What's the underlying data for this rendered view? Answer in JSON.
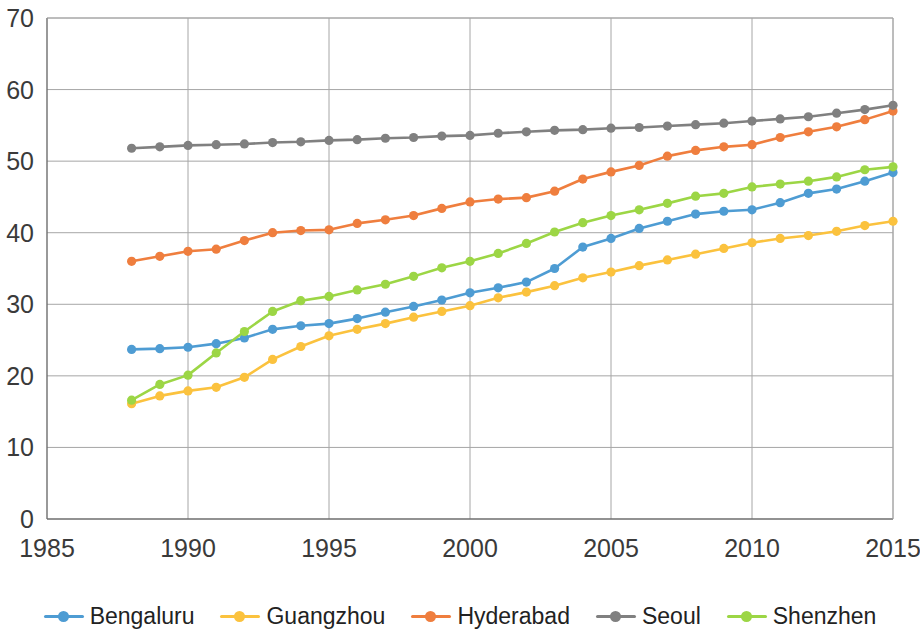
{
  "chart_data": {
    "type": "line",
    "title": "",
    "xlabel": "",
    "ylabel": "",
    "xlim": [
      1985,
      2015
    ],
    "ylim": [
      0,
      70
    ],
    "x_ticks": [
      1985,
      1990,
      1995,
      2000,
      2005,
      2010,
      2015
    ],
    "y_ticks": [
      0,
      10,
      20,
      30,
      40,
      50,
      60,
      70
    ],
    "grid": true,
    "legend_position": "bottom",
    "markers": "circle",
    "x": [
      1988,
      1989,
      1990,
      1991,
      1992,
      1993,
      1994,
      1995,
      1996,
      1997,
      1998,
      1999,
      2000,
      2001,
      2002,
      2003,
      2004,
      2005,
      2006,
      2007,
      2008,
      2009,
      2010,
      2011,
      2012,
      2013,
      2014,
      2015
    ],
    "series": [
      {
        "name": "Bengaluru",
        "color": "#4E9CD3",
        "values": [
          23.7,
          23.8,
          24.0,
          24.5,
          25.3,
          26.5,
          27.0,
          27.3,
          28.0,
          28.9,
          29.7,
          30.6,
          31.6,
          32.3,
          33.1,
          35.0,
          38.0,
          39.2,
          40.6,
          41.6,
          42.6,
          43.0,
          43.2,
          44.2,
          45.5,
          46.1,
          47.2,
          48.4
        ]
      },
      {
        "name": "Guangzhou",
        "color": "#FBC23E",
        "values": [
          16.1,
          17.2,
          17.9,
          18.4,
          19.8,
          22.3,
          24.1,
          25.6,
          26.5,
          27.3,
          28.2,
          29.0,
          29.8,
          30.9,
          31.7,
          32.6,
          33.7,
          34.5,
          35.4,
          36.2,
          37.0,
          37.8,
          38.6,
          39.2,
          39.6,
          40.2,
          41.0,
          41.6
        ]
      },
      {
        "name": "Hyderabad",
        "color": "#EF7E3E",
        "values": [
          36.0,
          36.7,
          37.4,
          37.7,
          38.9,
          40.0,
          40.3,
          40.4,
          41.3,
          41.8,
          42.4,
          43.4,
          44.3,
          44.7,
          44.9,
          45.8,
          47.5,
          48.5,
          49.4,
          50.7,
          51.5,
          52.0,
          52.3,
          53.3,
          54.1,
          54.8,
          55.8,
          57.0
        ]
      },
      {
        "name": "Seoul",
        "color": "#808080",
        "values": [
          51.8,
          52.0,
          52.2,
          52.3,
          52.4,
          52.6,
          52.7,
          52.9,
          53.0,
          53.2,
          53.3,
          53.5,
          53.6,
          53.9,
          54.1,
          54.3,
          54.4,
          54.6,
          54.7,
          54.9,
          55.1,
          55.3,
          55.6,
          55.9,
          56.2,
          56.7,
          57.2,
          57.8
        ]
      },
      {
        "name": "Shenzhen",
        "color": "#9CD645",
        "values": [
          16.6,
          18.8,
          20.1,
          23.2,
          26.2,
          29.0,
          30.5,
          31.1,
          32.0,
          32.8,
          33.9,
          35.1,
          36.0,
          37.1,
          38.5,
          40.1,
          41.4,
          42.4,
          43.2,
          44.1,
          45.1,
          45.5,
          46.4,
          46.8,
          47.2,
          47.8,
          48.8,
          49.2
        ]
      }
    ]
  },
  "axis": {
    "y_tick_labels": [
      "70",
      "60",
      "50",
      "40",
      "30",
      "20",
      "10",
      "0"
    ],
    "x_tick_labels": [
      "1985",
      "1990",
      "1995",
      "2000",
      "2005",
      "2010",
      "2015"
    ]
  },
  "legend": {
    "items": [
      {
        "label": "Bengaluru",
        "color": "#4E9CD3"
      },
      {
        "label": "Guangzhou",
        "color": "#FBC23E"
      },
      {
        "label": "Hyderabad",
        "color": "#EF7E3E"
      },
      {
        "label": "Seoul",
        "color": "#808080"
      },
      {
        "label": "Shenzhen",
        "color": "#9CD645"
      }
    ]
  }
}
